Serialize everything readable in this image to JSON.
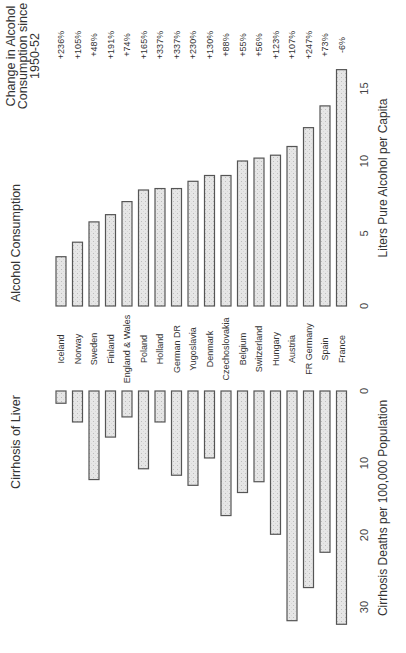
{
  "colors": {
    "bar_fill": "#e6e6e6",
    "bar_stroke": "#555555",
    "text": "#333333"
  },
  "headers": {
    "change": [
      "Change in Alcohol",
      "Consumption since",
      "1950-52"
    ],
    "consumption": "Alcohol Consumption",
    "cirrhosis": "Cirrhosis of Liver"
  },
  "chart_data": [
    {
      "type": "bar",
      "title": "Alcohol Consumption",
      "xlabel": "",
      "ylabel": "Liters Pure Alcohol per Capita",
      "ylim": [
        0,
        16.5
      ],
      "yticks": [
        0,
        5,
        10,
        15
      ],
      "orientation": "vertical (rotated page)",
      "grid": false,
      "categories": [
        "Iceland",
        "Norway",
        "Sweden",
        "Finland",
        "England & Wales",
        "Poland",
        "Holland",
        "German DR",
        "Yugoslavia",
        "Denmark",
        "Czechoslovakia",
        "Belgium",
        "Switzerland",
        "Hungary",
        "Austria",
        "FR Germany",
        "Spain",
        "France"
      ],
      "values": [
        3.4,
        4.4,
        5.8,
        6.3,
        7.2,
        8.0,
        8.1,
        8.1,
        8.6,
        9.0,
        9.0,
        10.0,
        10.2,
        10.4,
        11.0,
        12.3,
        13.8,
        16.3
      ],
      "annotations": {
        "label": "Change in Alcohol Consumption since 1950-52",
        "values": [
          "+236%",
          "+105%",
          "+48%",
          "+191%",
          "+74%",
          "+165%",
          "+337%",
          "+337%",
          "+230%",
          "+130%",
          "+88%",
          "+55%",
          "+56%",
          "+123%",
          "+107%",
          "+247%",
          "+73%",
          "-6%"
        ]
      }
    },
    {
      "type": "bar",
      "title": "Cirrhosis of Liver",
      "xlabel": "",
      "ylabel": "Cirrhosis Deaths per 100,000 Population",
      "ylim": [
        0,
        33
      ],
      "yticks": [
        0,
        10,
        20,
        30
      ],
      "grid": false,
      "categories": [
        "Iceland",
        "Norway",
        "Sweden",
        "Finland",
        "England & Wales",
        "Poland",
        "Holland",
        "German DR",
        "Yugoslavia",
        "Denmark",
        "Czechoslovakia",
        "Belgium",
        "Switzerland",
        "Hungary",
        "Austria",
        "FR Germany",
        "Spain",
        "France"
      ],
      "values": [
        1.7,
        4.3,
        12.3,
        6.4,
        3.6,
        10.8,
        4.3,
        11.7,
        13.1,
        9.3,
        17.3,
        14.1,
        12.6,
        19.9,
        31.9,
        27.3,
        22.4,
        32.4
      ]
    }
  ]
}
